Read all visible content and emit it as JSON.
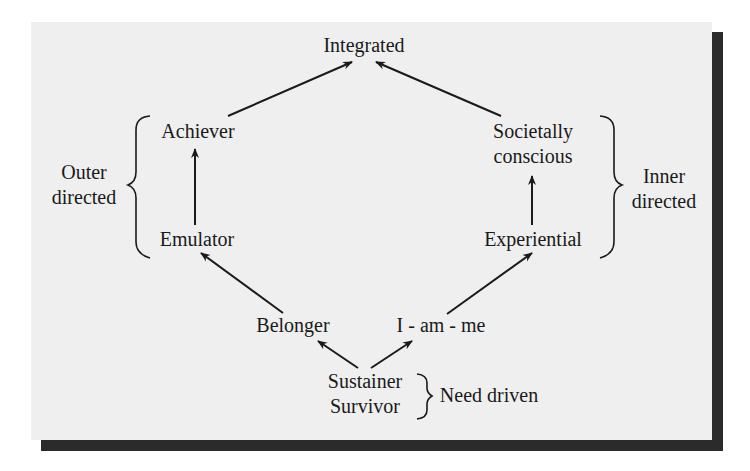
{
  "diagram": {
    "type": "VALS lifestyle hierarchy",
    "nodes": {
      "integrated": "Integrated",
      "achiever": "Achiever",
      "societally_1": "Societally",
      "societally_2": "conscious",
      "emulator": "Emulator",
      "experiential": "Experiential",
      "belonger": "Belonger",
      "i_am_me": "I - am - me",
      "sustainer": "Sustainer",
      "survivor": "Survivor"
    },
    "groups": {
      "outer_1": "Outer",
      "outer_2": "directed",
      "inner_1": "Inner",
      "inner_2": "directed",
      "need": "Need driven"
    },
    "edges": [
      [
        "Sustainer/Survivor",
        "Belonger"
      ],
      [
        "Sustainer/Survivor",
        "I-am-me"
      ],
      [
        "Belonger",
        "Emulator"
      ],
      [
        "I-am-me",
        "Experiential"
      ],
      [
        "Emulator",
        "Achiever"
      ],
      [
        "Experiential",
        "Societally conscious"
      ],
      [
        "Achiever",
        "Integrated"
      ],
      [
        "Societally conscious",
        "Integrated"
      ]
    ],
    "colors": {
      "panel": "#efefef",
      "shadow": "#2b2b2b",
      "ink": "#1a1a1a"
    }
  }
}
